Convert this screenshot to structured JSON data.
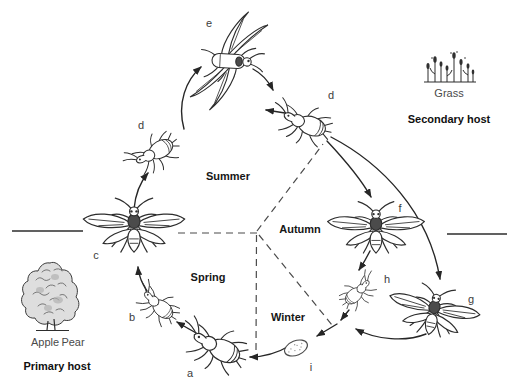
{
  "figure": {
    "kind": "aphid-life-cycle-diagram"
  },
  "stage_labels": {
    "a": "a",
    "b": "b",
    "c": "c",
    "d_left": "d",
    "d_right": "d",
    "e": "e",
    "f": "f",
    "g": "g",
    "h": "h",
    "i": "i"
  },
  "season_labels": {
    "summer": "Summer",
    "autumn": "Autumn",
    "spring": "Spring",
    "winter": "Winter"
  },
  "hosts": {
    "primary": {
      "plants": [
        "Apple",
        "Pear"
      ],
      "caption": "Primary host",
      "icon": "apple-pear-tree-icon"
    },
    "secondary": {
      "plant": "Grass",
      "caption": "Secondary host",
      "icon": "grass-icon"
    }
  },
  "icons": {
    "wingless_aphid": "wingless-aphid-icon",
    "winged_aphid": "winged-aphid-icon",
    "flying_aphid": "flying-winged-aphid-icon",
    "egg": "aphid-egg-icon"
  },
  "colors": {
    "ink": "#2d2d2d",
    "text": "#161616",
    "muted_text": "#4a4a4a",
    "background": "#ffffff"
  }
}
